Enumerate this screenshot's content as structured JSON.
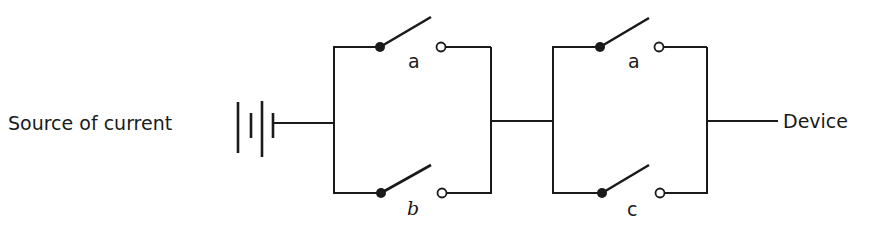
{
  "diagram": {
    "type": "circuit",
    "source_label": "Source of current",
    "device_label": "Device",
    "blocks": [
      {
        "name": "parallel-block-1",
        "switches": [
          {
            "position": "top",
            "label": "a",
            "state": "open"
          },
          {
            "position": "bottom",
            "label": "b",
            "state": "open"
          }
        ]
      },
      {
        "name": "parallel-block-2",
        "switches": [
          {
            "position": "top",
            "label": "a",
            "state": "open"
          },
          {
            "position": "bottom",
            "label": "c",
            "state": "open"
          }
        ]
      }
    ],
    "colors": {
      "line": "#1a1a1a",
      "background": "#ffffff"
    }
  }
}
